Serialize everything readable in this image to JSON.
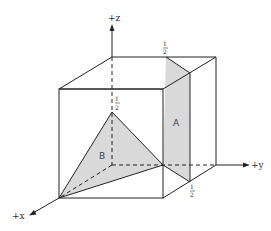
{
  "diagram": {
    "axes": {
      "x": {
        "label": "+x"
      },
      "y": {
        "label": "+y"
      },
      "z": {
        "label": "+z"
      }
    },
    "planes": [
      {
        "name": "A",
        "label": "A"
      },
      {
        "name": "B",
        "label": "B"
      }
    ],
    "intercepts": {
      "z_half": {
        "num": "1",
        "den": "2"
      },
      "top_half": {
        "num": "1",
        "den": "2"
      },
      "y_half": {
        "num": "1",
        "den": "2"
      }
    },
    "colors": {
      "stroke": "#222222",
      "fill": "#d9d9d9",
      "background": "#ffffff"
    }
  }
}
